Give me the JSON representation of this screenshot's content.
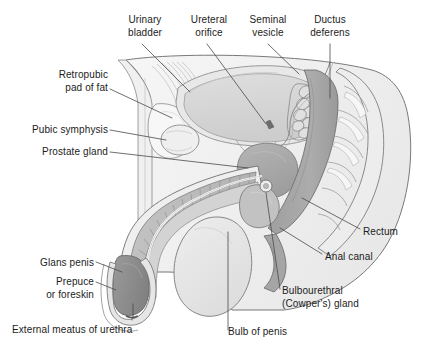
{
  "figure": {
    "background_color": "#ffffff",
    "label_color": "#1c1c1c",
    "leader_color": "#4a4a4a"
  },
  "palette": {
    "outline": "#5a5a5a",
    "body_fill": "#f2f2f2",
    "body_fill_2": "#e9e9e9",
    "bladder": "#d8d8d8",
    "bladder_wall": "#cfcfcf",
    "prostate": "#a8a8a8",
    "rectum": "#a9a9a9",
    "seminal_vesicle": "#dcdcdc",
    "scrotum": "#e4e4e4",
    "glans": "#8f8f8f",
    "corpus": "#bdbdbd",
    "urethra": "#ffffff",
    "bone": "#ededed",
    "fat": "#f5f5f5",
    "muscle": "#dedede"
  },
  "labels": [
    {
      "id": "urinary-bladder",
      "text": "Urinary\nbladder",
      "align": "center",
      "x": 110,
      "y": 14,
      "w": 70
    },
    {
      "id": "ureteral-orifice",
      "text": "Ureteral\norifice",
      "align": "center",
      "x": 177,
      "y": 14,
      "w": 64
    },
    {
      "id": "seminal-vesicle",
      "text": "Seminal\nvesicle",
      "align": "center",
      "x": 236,
      "y": 14,
      "w": 64
    },
    {
      "id": "ductus-deferens",
      "text": "Ductus\ndeferens",
      "align": "center",
      "x": 296,
      "y": 14,
      "w": 68
    },
    {
      "id": "retropubic-pad-of-fat",
      "text": "Retropubic\npad of fat",
      "align": "right",
      "x": 20,
      "y": 69,
      "w": 88
    },
    {
      "id": "pubic-symphysis",
      "text": "Pubic symphysis",
      "align": "right",
      "x": 8,
      "y": 124,
      "w": 100
    },
    {
      "id": "prostate-gland",
      "text": "Prostate gland",
      "align": "right",
      "x": 18,
      "y": 146,
      "w": 90
    },
    {
      "id": "rectum",
      "text": "Rectum",
      "align": "left",
      "x": 363,
      "y": 226,
      "w": 56
    },
    {
      "id": "anal-canal",
      "text": "Anal canal",
      "align": "left",
      "x": 325,
      "y": 251,
      "w": 70
    },
    {
      "id": "glans-penis",
      "text": "Glans penis",
      "align": "right",
      "x": 18,
      "y": 257,
      "w": 76
    },
    {
      "id": "prepuce-or-foreskin",
      "text": "Prepuce\nor foreskin",
      "align": "right",
      "x": 18,
      "y": 276,
      "w": 76
    },
    {
      "id": "bulbourethral-cowpers-gland",
      "text": "Bulbourethral\n(Cowper's) gland",
      "align": "left",
      "x": 282,
      "y": 285,
      "w": 110
    },
    {
      "id": "external-meatus-of-urethra",
      "text": "External meatus of urethra",
      "align": "left",
      "x": 12,
      "y": 324,
      "w": 156
    },
    {
      "id": "bulb-of-penis",
      "text": "Bulb of penis",
      "align": "left",
      "x": 228,
      "y": 326,
      "w": 84
    }
  ],
  "structures": [
    {
      "id": "urinary-bladder",
      "name": "Urinary bladder"
    },
    {
      "id": "ureteral-orifice",
      "name": "Ureteral orifice"
    },
    {
      "id": "seminal-vesicle",
      "name": "Seminal vesicle"
    },
    {
      "id": "ductus-deferens",
      "name": "Ductus deferens"
    },
    {
      "id": "retropubic-pad-of-fat",
      "name": "Retropubic pad of fat"
    },
    {
      "id": "pubic-symphysis",
      "name": "Pubic symphysis"
    },
    {
      "id": "prostate-gland",
      "name": "Prostate gland"
    },
    {
      "id": "rectum",
      "name": "Rectum"
    },
    {
      "id": "anal-canal",
      "name": "Anal canal"
    },
    {
      "id": "glans-penis",
      "name": "Glans penis"
    },
    {
      "id": "prepuce-or-foreskin",
      "name": "Prepuce or foreskin"
    },
    {
      "id": "bulbourethral-gland",
      "name": "Bulbourethral (Cowper's) gland"
    },
    {
      "id": "external-meatus-of-urethra",
      "name": "External meatus of urethra"
    },
    {
      "id": "bulb-of-penis",
      "name": "Bulb of penis"
    },
    {
      "id": "scrotum",
      "name": "Scrotum"
    },
    {
      "id": "sacrum-coccyx",
      "name": "Sacrum and coccyx"
    },
    {
      "id": "abdominal-wall",
      "name": "Abdominal wall"
    },
    {
      "id": "corpus-cavernosum",
      "name": "Corpus cavernosum"
    },
    {
      "id": "urethra",
      "name": "Urethra"
    }
  ]
}
